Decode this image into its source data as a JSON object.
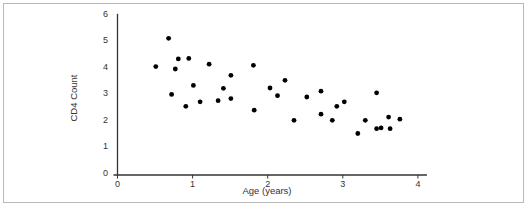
{
  "figure": {
    "frame_color": "#b9b9b9",
    "axis_color": "#333333",
    "point_color": "#000000"
  },
  "chart_data": {
    "type": "scatter",
    "title": "",
    "xlabel": "Age (years)",
    "ylabel": "CD4 Count",
    "xlim": [
      0,
      4
    ],
    "ylim": [
      0,
      6
    ],
    "x_ticks": [
      "0",
      "1",
      "2",
      "3",
      "4"
    ],
    "y_ticks": [
      "0",
      "1",
      "2",
      "3",
      "4",
      "5",
      "6"
    ],
    "grid": false,
    "legend": null,
    "points": [
      {
        "x": 0.51,
        "y": 4.08
      },
      {
        "x": 0.68,
        "y": 5.15
      },
      {
        "x": 0.72,
        "y": 3.03
      },
      {
        "x": 0.77,
        "y": 3.99
      },
      {
        "x": 0.81,
        "y": 4.37
      },
      {
        "x": 0.91,
        "y": 2.58
      },
      {
        "x": 0.95,
        "y": 4.39
      },
      {
        "x": 1.01,
        "y": 3.37
      },
      {
        "x": 1.1,
        "y": 2.75
      },
      {
        "x": 1.22,
        "y": 4.17
      },
      {
        "x": 1.34,
        "y": 2.79
      },
      {
        "x": 1.41,
        "y": 3.26
      },
      {
        "x": 1.51,
        "y": 3.75
      },
      {
        "x": 1.51,
        "y": 2.87
      },
      {
        "x": 1.81,
        "y": 4.13
      },
      {
        "x": 1.82,
        "y": 2.43
      },
      {
        "x": 2.03,
        "y": 3.27
      },
      {
        "x": 2.13,
        "y": 2.98
      },
      {
        "x": 2.23,
        "y": 3.56
      },
      {
        "x": 2.35,
        "y": 2.05
      },
      {
        "x": 2.52,
        "y": 2.93
      },
      {
        "x": 2.71,
        "y": 3.15
      },
      {
        "x": 2.71,
        "y": 2.28
      },
      {
        "x": 2.86,
        "y": 2.05
      },
      {
        "x": 2.92,
        "y": 2.58
      },
      {
        "x": 3.02,
        "y": 2.75
      },
      {
        "x": 3.2,
        "y": 1.55
      },
      {
        "x": 3.3,
        "y": 2.05
      },
      {
        "x": 3.45,
        "y": 3.09
      },
      {
        "x": 3.45,
        "y": 1.73
      },
      {
        "x": 3.51,
        "y": 1.76
      },
      {
        "x": 3.61,
        "y": 2.17
      },
      {
        "x": 3.63,
        "y": 1.73
      },
      {
        "x": 3.76,
        "y": 2.09
      }
    ]
  },
  "caption": {
    "text": "",
    "clipped": true
  }
}
